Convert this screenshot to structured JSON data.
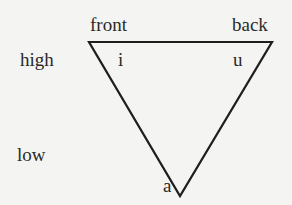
{
  "diagram": {
    "axes": {
      "top_left": "front",
      "top_right": "back",
      "left_upper": "high",
      "left_lower": "low"
    },
    "vowels": [
      {
        "symbol": "i",
        "position": "high front"
      },
      {
        "symbol": "u",
        "position": "high back"
      },
      {
        "symbol": "a",
        "position": "low"
      }
    ],
    "shape": "inverted-triangle",
    "colors": {
      "line": "#1e1e1e",
      "text": "#2a2a2a",
      "background": "#f4f4f2"
    }
  }
}
